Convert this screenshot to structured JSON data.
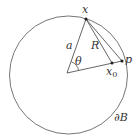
{
  "diagram": {
    "type": "geometry",
    "colors": {
      "stroke": "#555555",
      "text": "#333333",
      "background": "#ffffff"
    },
    "circle": {
      "cx": 68.5,
      "cy": 75,
      "r": 59
    },
    "points": {
      "center": {
        "x": 67,
        "y": 73
      },
      "x": {
        "x": 86,
        "y": 19
      },
      "p": {
        "x": 122,
        "y": 61
      },
      "x0": {
        "x": 112,
        "y": 63
      }
    },
    "labels": {
      "x": "x",
      "p": "p",
      "x0_main": "x",
      "x0_sub": "0",
      "a": "a",
      "R": "R",
      "theta": "θ",
      "boundary": "∂B"
    }
  }
}
